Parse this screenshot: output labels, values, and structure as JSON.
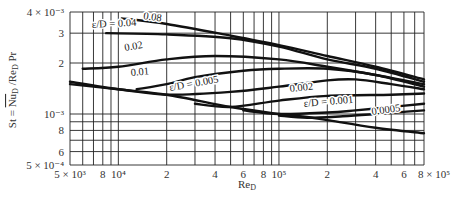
{
  "chart_data": {
    "type": "line",
    "title": "",
    "xlabel": "Re_D",
    "ylabel": "St = Nu_D / Re_D Pr",
    "xscale": "log",
    "yscale": "log",
    "xlim": [
      5000,
      800000
    ],
    "ylim": [
      0.0005,
      0.004
    ],
    "grid": true,
    "legend": "inline labels on curves",
    "x_tick_labels": [
      "5 × 10³",
      "8",
      "10⁴",
      "2",
      "4",
      "6",
      "8",
      "10⁵",
      "2",
      "4",
      "6",
      "8 × 10⁵"
    ],
    "x_tick_values": [
      5000,
      8000,
      10000,
      20000,
      40000,
      60000,
      80000,
      100000,
      200000,
      400000,
      600000,
      800000
    ],
    "y_tick_labels": [
      "4 × 10⁻³",
      "3",
      "2",
      "10⁻³",
      "8",
      "6",
      "5 × 10⁻⁴"
    ],
    "y_tick_values": [
      0.004,
      0.003,
      0.002,
      0.001,
      0.0008,
      0.0006,
      0.0005
    ],
    "series": [
      {
        "name": "ε/D = 0.08",
        "label": "0.08",
        "x": [
          10500,
          20000,
          50000,
          100000,
          200000,
          400000,
          800000
        ],
        "y": [
          0.00367,
          0.0034,
          0.0029,
          0.00255,
          0.0022,
          0.0019,
          0.0016
        ]
      },
      {
        "name": "ε/D = 0.04",
        "label": "ε/D = 0.04",
        "x": [
          8400,
          20000,
          50000,
          100000,
          200000,
          400000,
          800000
        ],
        "y": [
          0.003,
          0.00295,
          0.0028,
          0.0025,
          0.0021,
          0.00185,
          0.00155
        ]
      },
      {
        "name": "ε/D = 0.02",
        "label": "0.02",
        "x": [
          6000,
          10000,
          20000,
          40000,
          100000,
          200000,
          400000,
          800000
        ],
        "y": [
          0.00185,
          0.0019,
          0.0021,
          0.0022,
          0.0021,
          0.0019,
          0.0017,
          0.0015
        ]
      },
      {
        "name": "ε/D = 0.01",
        "label": "0.01",
        "x": [
          13000,
          20000,
          30000,
          60000,
          100000,
          200000,
          400000,
          800000
        ],
        "y": [
          0.0014,
          0.0015,
          0.00165,
          0.0018,
          0.00185,
          0.00185,
          0.0017,
          0.00145
        ]
      },
      {
        "name": "ε/D = 0.005",
        "label": "ε/D = 0.005",
        "x": [
          5000,
          10000,
          20000,
          50000,
          100000,
          200000,
          300000,
          500000,
          800000
        ],
        "y": [
          0.0015,
          0.0014,
          0.0013,
          0.00135,
          0.00145,
          0.00158,
          0.0016,
          0.0015,
          0.0014
        ]
      },
      {
        "name": "ε/D = 0.002",
        "label": "0.002",
        "x": [
          30000,
          50000,
          100000,
          200000,
          500000,
          800000
        ],
        "y": [
          0.00115,
          0.0011,
          0.0012,
          0.00128,
          0.0013,
          0.00132
        ]
      },
      {
        "name": "ε/D = 0.001",
        "label": "ε/D = 0.001",
        "x": [
          60000,
          100000,
          200000,
          300000,
          500000,
          800000
        ],
        "y": [
          0.00105,
          0.001,
          0.00102,
          0.00105,
          0.0011,
          0.00115
        ]
      },
      {
        "name": "ε/D = 0.0005",
        "label": "0.0005",
        "x": [
          100000,
          150000,
          250000,
          400000,
          600000,
          800000
        ],
        "y": [
          0.00098,
          0.00095,
          0.00097,
          0.001,
          0.00103,
          0.00105
        ]
      },
      {
        "name": "Smooth",
        "label": "",
        "x": [
          5000,
          10000,
          20000,
          50000,
          100000,
          150000,
          200000,
          400000,
          800000
        ],
        "y": [
          0.00155,
          0.0014,
          0.0013,
          0.0011,
          0.001,
          0.00096,
          0.00092,
          0.00083,
          0.00077
        ]
      }
    ]
  },
  "labels": {
    "y_axis_title": "St = Nu_D / Re_D Pr",
    "x_axis_title": "Re_D"
  }
}
